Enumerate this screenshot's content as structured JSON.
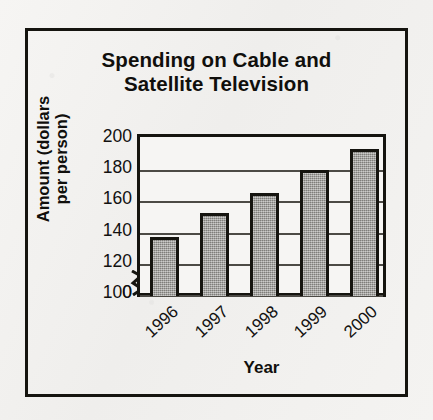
{
  "figure": {
    "title_lines": [
      "Spending on Cable and",
      "Satellite Television"
    ],
    "y_axis_title_lines": [
      "Amount (dollars",
      "per person)"
    ],
    "x_axis_title": "Year",
    "frame_color": "#15140f",
    "bar_fill_color": "#9b9a96",
    "background_color": "#f3f2f0",
    "gridline_color": "#4c4a45",
    "axis_break_symbol": "zigzag-break"
  },
  "chart_data": {
    "type": "bar",
    "title": "Spending on Cable and Satellite Television",
    "xlabel": "Year",
    "ylabel": "Amount (dollars per person)",
    "categories": [
      "1996",
      "1997",
      "1998",
      "1999",
      "2000"
    ],
    "values": [
      138,
      153,
      166,
      181,
      194
    ],
    "ylim": [
      0,
      200
    ],
    "y_axis_break": true,
    "y_break_range": [
      0,
      100
    ],
    "yticks": [
      0,
      100,
      120,
      140,
      160,
      180,
      200
    ],
    "ytick_labels": [
      "0",
      "100",
      "120",
      "140",
      "160",
      "180",
      "200"
    ],
    "gridlines": [
      100,
      120,
      140,
      160,
      180
    ],
    "grid": true,
    "legend": null,
    "legend_position": "none",
    "xtick_rotation_degrees": -42,
    "units": "dollars per person"
  }
}
